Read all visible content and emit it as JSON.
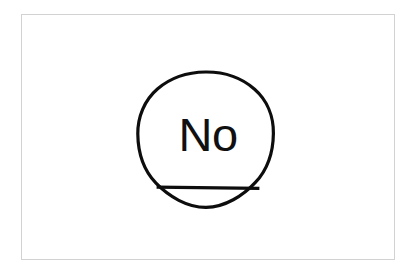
{
  "canvas": {
    "width": 416,
    "height": 274,
    "background_color": "#ffffff"
  },
  "frame": {
    "name": "image-border",
    "border_color": "#d2d2d2",
    "border_width": 1.5,
    "left": 21,
    "top": 14,
    "width": 374,
    "height": 246
  },
  "drawing": {
    "title": "",
    "stroke_color": "#0d0d0d",
    "stroke_width": 3.2,
    "fill": "none",
    "shapes": [
      {
        "name": "circle-outline",
        "type": "circle",
        "cx": 205.5,
        "cy": 139.5,
        "r": 67.5
      },
      {
        "name": "chord-line",
        "type": "line",
        "x1": 156.5,
        "y1": 188.0,
        "x2": 259.5,
        "y2": 188.0
      }
    ]
  },
  "label": {
    "name": "no-label",
    "text": "No",
    "color": "#101010",
    "font_size": 47,
    "center_x": 206,
    "top": 111
  }
}
